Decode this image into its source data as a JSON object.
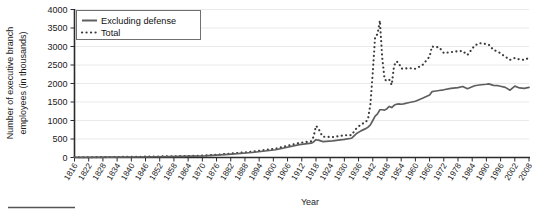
{
  "chart_data": {
    "type": "line",
    "title": "",
    "xlabel": "Year",
    "ylabel": "Number of executive branch employees (in thousands)",
    "xlim": [
      1816,
      2008
    ],
    "ylim": [
      0,
      4000
    ],
    "grid": true,
    "legend_position": "top-left",
    "y_ticks": [
      0,
      500,
      1000,
      1500,
      2000,
      2500,
      3000,
      3500,
      4000
    ],
    "x_ticks": [
      1816,
      1822,
      1828,
      1834,
      1840,
      1846,
      1852,
      1858,
      1864,
      1870,
      1876,
      1882,
      1888,
      1894,
      1900,
      1906,
      1912,
      1918,
      1924,
      1930,
      1936,
      1942,
      1948,
      1954,
      1960,
      1966,
      1972,
      1978,
      1984,
      1990,
      1996,
      2002,
      2008
    ],
    "x": [
      1816,
      1821,
      1831,
      1841,
      1851,
      1861,
      1871,
      1881,
      1891,
      1901,
      1911,
      1916,
      1917,
      1918,
      1919,
      1920,
      1921,
      1925,
      1930,
      1933,
      1935,
      1937,
      1939,
      1940,
      1941,
      1942,
      1943,
      1944,
      1945,
      1946,
      1947,
      1948,
      1949,
      1950,
      1951,
      1952,
      1953,
      1954,
      1955,
      1957,
      1960,
      1963,
      1966,
      1967,
      1968,
      1970,
      1972,
      1975,
      1978,
      1980,
      1982,
      1985,
      1987,
      1990,
      1991,
      1993,
      1995,
      1998,
      2000,
      2002,
      2004,
      2006,
      2008
    ],
    "series": [
      {
        "name": "Total",
        "style": "dotted",
        "color": "#3a3a3a",
        "values": [
          5,
          7,
          12,
          19,
          27,
          37,
          53,
          100,
          158,
          240,
          396,
          438,
          563,
          855,
          795,
          655,
          561,
          553,
          601,
          604,
          780,
          896,
          953,
          1042,
          1438,
          2296,
          3270,
          3332,
          3700,
          2696,
          2111,
          2071,
          2102,
          1961,
          2482,
          2600,
          2558,
          2407,
          2397,
          2417,
          2399,
          2498,
          2726,
          3002,
          2985,
          2982,
          2824,
          2848,
          2875,
          2876,
          2770,
          3021,
          3091,
          3067,
          3048,
          2906,
          2858,
          2727,
          2639,
          2690,
          2650,
          2637,
          2692
        ]
      },
      {
        "name": "Excluding defense",
        "style": "solid",
        "color": "#5f5f5f",
        "values": [
          3,
          5,
          9,
          14,
          20,
          28,
          42,
          84,
          135,
          210,
          350,
          388,
          420,
          480,
          470,
          450,
          430,
          450,
          490,
          520,
          640,
          720,
          780,
          820,
          880,
          1000,
          1120,
          1180,
          1290,
          1290,
          1280,
          1320,
          1380,
          1350,
          1410,
          1440,
          1450,
          1440,
          1450,
          1480,
          1520,
          1600,
          1690,
          1780,
          1790,
          1810,
          1830,
          1870,
          1890,
          1920,
          1860,
          1940,
          1960,
          1980,
          1990,
          1950,
          1940,
          1895,
          1820,
          1930,
          1880,
          1870,
          1895
        ]
      }
    ]
  },
  "legend": {
    "items": [
      {
        "label": "Excluding defense",
        "style": "solid"
      },
      {
        "label": "Total",
        "style": "dotted"
      }
    ]
  }
}
